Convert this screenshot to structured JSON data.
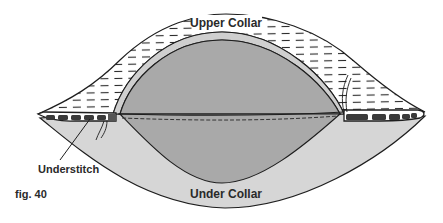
{
  "figure": {
    "caption": "fig. 40",
    "labels": {
      "upper_collar": "Upper Collar",
      "under_collar": "Under Collar",
      "understitch": "Understitch"
    },
    "colors": {
      "background": "#ffffff",
      "outline": "#1e1e1e",
      "upper_collar_fill": "#ffffff",
      "upper_collar_hatch": "#2a2a2a",
      "under_collar_fill": "#d6d6d6",
      "band_fill": "#cfcfcf",
      "lens_fill": "#a9a9a9"
    }
  }
}
